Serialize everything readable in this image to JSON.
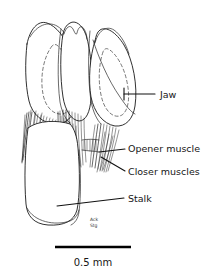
{
  "figure": {
    "background_color": "#ffffff",
    "ink_color": "#1a1a1a"
  },
  "labels": [
    {
      "id": "jaw",
      "text": "Jaw",
      "text_x": 160,
      "text_y": 95,
      "leader": {
        "x1": 124,
        "y1": 94,
        "x2": 155,
        "y2": 94
      }
    },
    {
      "id": "opener-muscle",
      "text": "Opener muscle",
      "text_x": 128,
      "text_y": 149,
      "leader": {
        "x1": 99,
        "y1": 152,
        "x2": 125,
        "y2": 149
      }
    },
    {
      "id": "closer-muscles",
      "text": "Closer muscles",
      "text_x": 128,
      "text_y": 172,
      "leader": {
        "x1": 101,
        "y1": 158,
        "x2": 125,
        "y2": 171
      }
    },
    {
      "id": "stalk",
      "text": "Stalk",
      "text_x": 128,
      "text_y": 199,
      "leader": {
        "x1": 57,
        "y1": 206,
        "x2": 124,
        "y2": 198
      }
    }
  ],
  "scale_bar": {
    "caption": "0.5 mm",
    "x1": 55,
    "x2": 131,
    "y": 247,
    "caption_x": 93,
    "caption_y": 263
  },
  "signature": {
    "line1": "Ack",
    "line2": "Stg",
    "x": 90,
    "y": 223
  }
}
